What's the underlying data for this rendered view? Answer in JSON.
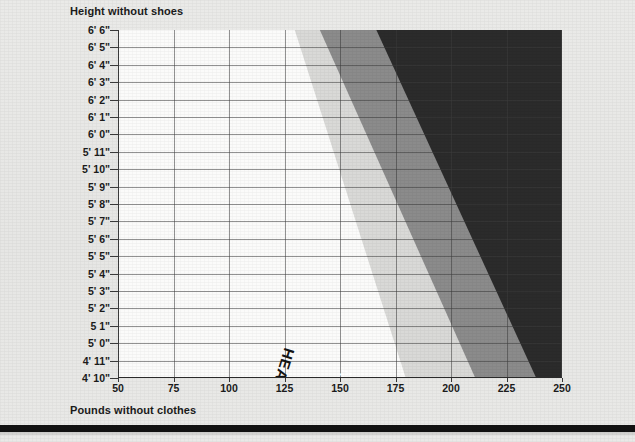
{
  "chart_data": {
    "type": "area",
    "title": "",
    "xlabel": "Pounds without clothes",
    "ylabel": "Height without shoes",
    "xlim": [
      50,
      250
    ],
    "ylim": [
      "4' 10\"",
      "6' 6\""
    ],
    "grid": true,
    "legend_position": "inline-diagonal-labels",
    "x_ticks": [
      50,
      75,
      100,
      125,
      150,
      175,
      200,
      225,
      250
    ],
    "x_tick_labels": [
      "50",
      "75",
      "100",
      "125",
      "150",
      "175",
      "200",
      "225",
      "250"
    ],
    "y_tick_labels": [
      "6' 6\"",
      "6' 5\"",
      "6' 4\"",
      "6' 3\"",
      "6' 2\"",
      "6' 1\"",
      "6' 0\"",
      "5' 11\"",
      "5' 10\"",
      "5' 9\"",
      "5' 8\"",
      "5' 7\"",
      "5' 6\"",
      "5' 5\"",
      "5' 4\"",
      "5' 3\"",
      "5' 2\"",
      "5 1\"",
      "5' 0\"",
      "4' 11\"",
      "4' 10\""
    ],
    "bands": [
      {
        "name": "healthy-weight",
        "label": "HEALTHY WEIGHT",
        "color": "#d9d9d7",
        "text_color": "#141414",
        "weight_at_bottom": 118,
        "weight_at_top": 168
      },
      {
        "name": "moderate-overweight",
        "label": "MODERATE OVERWEIGHT",
        "color": "#8b8b8b",
        "text_color": "#ffffff",
        "weight_at_bottom": 125,
        "weight_at_top": 195
      },
      {
        "name": "severe-overweight",
        "label": "SEVERE OVERWEIGHT",
        "color": "#2b2b2b",
        "text_color": "#ffffff",
        "weight_at_bottom": 150,
        "weight_at_top": 222
      }
    ]
  },
  "axes": {
    "y_title": "Height without shoes",
    "x_title": "Pounds without clothes"
  },
  "colors": {
    "page_background": "#e9e9e7",
    "plot_background": "#fbfbfa",
    "gridline": "#3c3c3c",
    "healthy_band": "#d9d9d7",
    "moderate_band": "#8b8b8b",
    "severe_band": "#2b2b2b",
    "text": "#1b1b1b",
    "bottom_rule": "#121212"
  }
}
